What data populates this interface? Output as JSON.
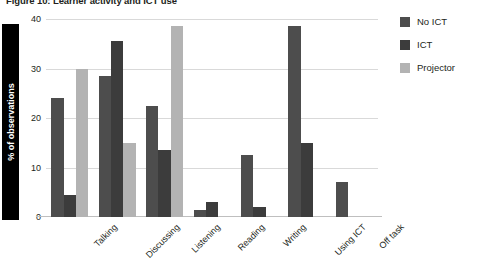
{
  "title": "Figure 10: Learner activity and ICT use",
  "chart_data": {
    "type": "bar",
    "title": "Figure 10: Learner activity and ICT use",
    "xlabel": "",
    "ylabel": "% of observations",
    "ylim": [
      0,
      40
    ],
    "yticks": [
      0,
      10,
      20,
      30,
      40
    ],
    "grid": true,
    "legend_position": "right",
    "categories": [
      "Talking",
      "Discussing",
      "Listening",
      "Reading",
      "Writing",
      "Using ICT",
      "Off task"
    ],
    "series": [
      {
        "name": "No ICT",
        "color": "#4d4d4d",
        "values": [
          24,
          28.5,
          22.5,
          1.5,
          12.5,
          38.5,
          7
        ]
      },
      {
        "name": "ICT",
        "color": "#3c3c3c",
        "values": [
          4.5,
          35.5,
          13.5,
          3,
          2,
          15,
          0
        ]
      },
      {
        "name": "Projector",
        "color": "#b3b3b3",
        "values": [
          30,
          15,
          38.5,
          0,
          0,
          0,
          0
        ]
      }
    ]
  },
  "axis": {
    "y_title": "% of observations",
    "y_ticks": [
      "0",
      "10",
      "20",
      "30",
      "40"
    ]
  },
  "legend": {
    "items": [
      {
        "label": "No ICT",
        "color": "#4d4d4d"
      },
      {
        "label": "ICT",
        "color": "#3c3c3c"
      },
      {
        "label": "Projector",
        "color": "#b3b3b3"
      }
    ]
  },
  "colors": {
    "no_ict": "#4d4d4d",
    "ict": "#3c3c3c",
    "projector": "#b3b3b3",
    "grid": "#d9d9d9",
    "text": "#231f20",
    "ylabel_bar": "#000000"
  }
}
